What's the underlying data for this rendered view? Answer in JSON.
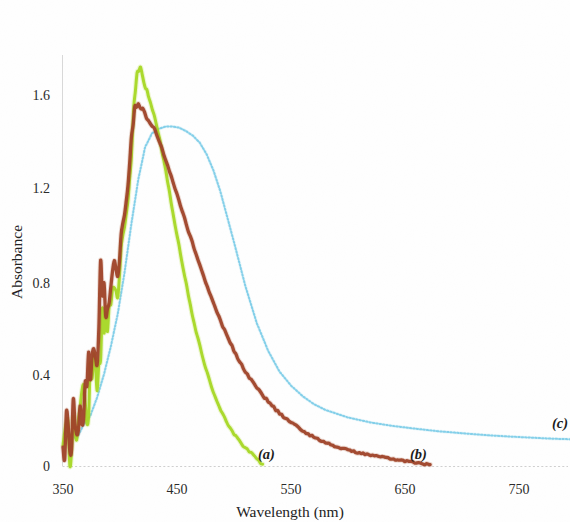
{
  "figure": {
    "background": "#ffffff",
    "width": 570,
    "height": 522
  },
  "axes": {
    "x_title": "Wavelength (nm)",
    "y_title": "Absorbance",
    "x_ticks": [
      "350",
      "450",
      "550",
      "650",
      "750"
    ],
    "y_ticks": [
      "0",
      "0.4",
      "0.8",
      "1.2",
      "1.6"
    ]
  },
  "annotations": {
    "a": "(a)",
    "b": "(b)",
    "c": "(c)"
  },
  "colors": {
    "curve_a": "#a8d827",
    "curve_b": "#a0462a",
    "curve_c": "#7ecde8",
    "axis": "#d8d8d8",
    "text": "#222222"
  },
  "chart_data": {
    "type": "line",
    "title": "",
    "xlabel": "Wavelength (nm)",
    "ylabel": "Absorbance",
    "xlim": [
      345,
      795
    ],
    "ylim": [
      0,
      1.85
    ],
    "xticks": [
      350,
      450,
      550,
      650,
      750
    ],
    "yticks": [
      0,
      0.4,
      0.8,
      1.2,
      1.6
    ],
    "grid": false,
    "legend": "inline-annotations",
    "series": [
      {
        "name": "(a)",
        "color": "#a8d827",
        "style": "solid",
        "peak_x": 412,
        "peak_y": 1.72,
        "x_end": 525,
        "x": [
          350,
          353,
          356,
          359,
          362,
          365,
          368,
          371,
          374,
          377,
          380,
          383,
          386,
          389,
          392,
          395,
          398,
          401,
          404,
          407,
          410,
          412,
          415,
          418,
          421,
          425,
          430,
          435,
          440,
          445,
          450,
          455,
          460,
          465,
          470,
          475,
          480,
          485,
          490,
          495,
          500,
          505,
          510,
          515,
          520,
          525
        ],
        "y": [
          0.05,
          0.12,
          0.09,
          0.17,
          0.14,
          0.24,
          0.3,
          0.27,
          0.38,
          0.46,
          0.42,
          0.55,
          0.63,
          0.58,
          0.72,
          0.8,
          0.76,
          0.92,
          1.02,
          1.14,
          1.34,
          1.55,
          1.7,
          1.72,
          1.66,
          1.6,
          1.52,
          1.41,
          1.28,
          1.14,
          1.0,
          0.87,
          0.74,
          0.62,
          0.52,
          0.43,
          0.35,
          0.28,
          0.23,
          0.18,
          0.14,
          0.11,
          0.08,
          0.06,
          0.03,
          0.01
        ]
      },
      {
        "name": "(b)",
        "color": "#a0462a",
        "style": "solid",
        "peak_x": 412,
        "peak_y": 1.57,
        "x_end": 672,
        "x": [
          350,
          353,
          356,
          359,
          362,
          365,
          368,
          371,
          374,
          377,
          380,
          383,
          386,
          389,
          392,
          395,
          398,
          401,
          404,
          407,
          410,
          413,
          416,
          420,
          425,
          430,
          435,
          440,
          450,
          460,
          470,
          480,
          490,
          500,
          510,
          520,
          530,
          540,
          550,
          560,
          570,
          580,
          590,
          600,
          610,
          620,
          630,
          640,
          650,
          660,
          672
        ],
        "y": [
          0.06,
          0.18,
          0.11,
          0.22,
          0.16,
          0.31,
          0.26,
          0.44,
          0.38,
          0.55,
          0.49,
          0.86,
          0.7,
          0.64,
          0.8,
          0.9,
          0.83,
          0.98,
          1.1,
          1.24,
          1.42,
          1.55,
          1.57,
          1.54,
          1.5,
          1.46,
          1.4,
          1.33,
          1.18,
          1.02,
          0.87,
          0.73,
          0.61,
          0.5,
          0.41,
          0.34,
          0.28,
          0.23,
          0.19,
          0.155,
          0.127,
          0.104,
          0.086,
          0.071,
          0.059,
          0.049,
          0.04,
          0.032,
          0.024,
          0.016,
          0.008
        ]
      },
      {
        "name": "(c)",
        "color": "#7ecde8",
        "style": "dotted",
        "peak_x": 452,
        "peak_y": 1.47,
        "x_end": 795,
        "x": [
          350,
          356,
          362,
          368,
          374,
          380,
          386,
          392,
          398,
          404,
          410,
          416,
          422,
          428,
          434,
          440,
          446,
          452,
          458,
          464,
          470,
          476,
          482,
          488,
          494,
          500,
          510,
          520,
          530,
          540,
          550,
          560,
          570,
          580,
          600,
          620,
          640,
          660,
          680,
          700,
          720,
          740,
          760,
          780,
          795
        ],
        "y": [
          0.1,
          0.14,
          0.12,
          0.18,
          0.22,
          0.3,
          0.4,
          0.52,
          0.66,
          0.84,
          1.05,
          1.24,
          1.38,
          1.44,
          1.46,
          1.47,
          1.47,
          1.465,
          1.45,
          1.43,
          1.4,
          1.35,
          1.28,
          1.19,
          1.08,
          0.97,
          0.78,
          0.62,
          0.5,
          0.41,
          0.35,
          0.305,
          0.27,
          0.245,
          0.212,
          0.19,
          0.175,
          0.163,
          0.152,
          0.144,
          0.136,
          0.13,
          0.125,
          0.12,
          0.118
        ]
      }
    ]
  }
}
